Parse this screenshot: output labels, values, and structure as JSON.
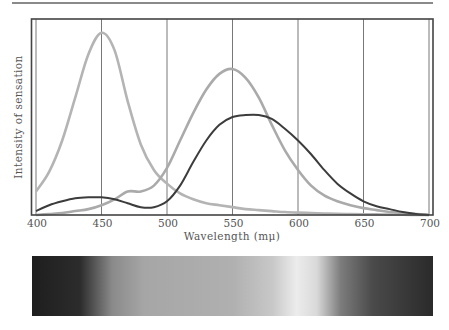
{
  "chart_data": {
    "type": "line",
    "title": "",
    "xlabel": "Wavelength (mμ)",
    "ylabel": "Intensity of sensation",
    "xlim": [
      400,
      700
    ],
    "ylim": [
      0,
      100
    ],
    "x_ticks": [
      400,
      450,
      500,
      550,
      600,
      650,
      700
    ],
    "x_tick_labels": [
      "400",
      "450",
      "500",
      "550",
      "600",
      "650",
      "700"
    ],
    "grid": {
      "vertical": true,
      "horizontal": false
    },
    "legend": null,
    "x": [
      400,
      410,
      420,
      430,
      440,
      450,
      460,
      470,
      480,
      490,
      500,
      510,
      520,
      530,
      540,
      550,
      560,
      570,
      580,
      590,
      600,
      610,
      620,
      630,
      640,
      650,
      660,
      670,
      680,
      690,
      700
    ],
    "series": [
      {
        "name": "blue-sensitive",
        "color": "#b4b4b4",
        "values": [
          12,
          22,
          38,
          60,
          82,
          93,
          84,
          58,
          36,
          23,
          16,
          11,
          8,
          6,
          5,
          4,
          3,
          2.5,
          2,
          1.5,
          1.2,
          1,
          0.8,
          0.6,
          0.5,
          0.4,
          0.3,
          0.2,
          0.1,
          0.05,
          0
        ]
      },
      {
        "name": "green-sensitive",
        "color": "#aaaaaa",
        "values": [
          0,
          0.5,
          1,
          2,
          3,
          5,
          8,
          12,
          12,
          15,
          24,
          38,
          52,
          64,
          72,
          74.5,
          70,
          60,
          46,
          33,
          23,
          15,
          10,
          7,
          5,
          3.5,
          2.5,
          1.5,
          1,
          0.5,
          0
        ]
      },
      {
        "name": "red-sensitive",
        "color": "#3c3c3c",
        "values": [
          2,
          5,
          7,
          8.5,
          9,
          9,
          8,
          6,
          4,
          4,
          7,
          15,
          27,
          38,
          46,
          50,
          51,
          51,
          49,
          44,
          38,
          31,
          23,
          16,
          11,
          7,
          4.5,
          3,
          1.5,
          0.5,
          0
        ]
      }
    ],
    "spectrum_bar": {
      "description": "grayscale visible spectrum strip below the chart",
      "stops": [
        {
          "pos": 0,
          "color": "#1e1e1e"
        },
        {
          "pos": 0.12,
          "color": "#2c2c2c"
        },
        {
          "pos": 0.2,
          "color": "#8a8a8a"
        },
        {
          "pos": 0.28,
          "color": "#a6a6a6"
        },
        {
          "pos": 0.5,
          "color": "#b0b0b0"
        },
        {
          "pos": 0.6,
          "color": "#c8c8c8"
        },
        {
          "pos": 0.66,
          "color": "#ececec"
        },
        {
          "pos": 0.71,
          "color": "#d9d9d9"
        },
        {
          "pos": 0.77,
          "color": "#7c7c7c"
        },
        {
          "pos": 0.85,
          "color": "#4a4a4a"
        },
        {
          "pos": 1,
          "color": "#2a2a2a"
        }
      ]
    }
  },
  "labels": {
    "ylabel": "Intensity of sensation",
    "xlabel": "Wavelength (mμ)"
  }
}
